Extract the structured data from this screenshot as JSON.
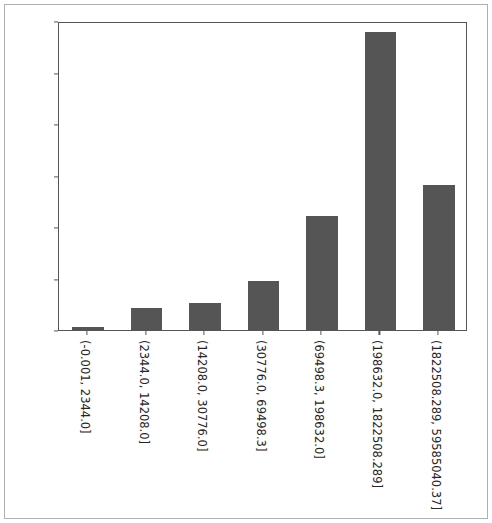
{
  "chart_data": {
    "type": "bar",
    "title": "",
    "xlabel": "",
    "ylabel": "",
    "ylim": [
      0.0,
      0.006
    ],
    "yticks": [
      "0.000",
      "0.001",
      "0.002",
      "0.003",
      "0.004",
      "0.005",
      "0.006"
    ],
    "ytick_values": [
      0.0,
      0.001,
      0.002,
      0.003,
      0.004,
      0.005,
      0.006
    ],
    "grid": false,
    "legend": null,
    "bar_color": "#555555",
    "categories": [
      "(-0.001, 2344.0]",
      "(2344.0, 14208.0]",
      "(14208.0, 30776.0]",
      "(30776.0, 69498.3]",
      "(69498.3, 198632.0]",
      "(198632.0, 1822508.289]",
      "(1822508.289, 59585040.37]"
    ],
    "values": [
      5e-05,
      0.00043,
      0.00052,
      0.00096,
      0.00222,
      0.00578,
      0.00282
    ]
  }
}
